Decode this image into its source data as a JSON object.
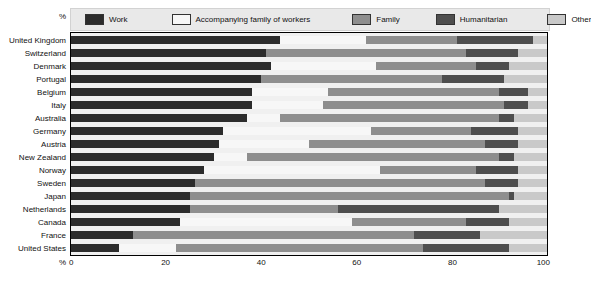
{
  "chart": {
    "title": "",
    "axis_unit_label": "%",
    "xlabel": "",
    "ylabel": ""
  },
  "legend": {
    "unit": "%",
    "items": [
      {
        "label": "Work",
        "color": "#2c2c2c",
        "key": "work"
      },
      {
        "label": "Accompanying family of workers",
        "color": "#f7f7f7",
        "key": "accomp"
      },
      {
        "label": "Family",
        "color": "#8e8e8e",
        "key": "family"
      },
      {
        "label": "Humanitarian",
        "color": "#4e4e4e",
        "key": "human"
      },
      {
        "label": "Other",
        "color": "#c9c9c9",
        "key": "other"
      }
    ]
  },
  "chart_data": {
    "type": "bar",
    "orientation": "horizontal",
    "stacked": true,
    "stack_total": 100,
    "title": "",
    "xlabel": "%",
    "ylabel": "",
    "xlim": [
      0,
      100
    ],
    "xticks": [
      0,
      20,
      40,
      60,
      80,
      100
    ],
    "grid": false,
    "legend_position": "top",
    "categories": [
      "United Kingdom",
      "Switzerland",
      "Denmark",
      "Portugal",
      "Belgium",
      "Italy",
      "Australia",
      "Germany",
      "Austria",
      "New Zealand",
      "Norway",
      "Sweden",
      "Japan",
      "Netherlands",
      "Canada",
      "France",
      "United States"
    ],
    "series": [
      {
        "name": "Work",
        "color": "#2c2c2c",
        "values": [
          44,
          41,
          42,
          40,
          38,
          38,
          37,
          32,
          31,
          30,
          28,
          26,
          25,
          25,
          23,
          13,
          10
        ]
      },
      {
        "name": "Accompanying family of workers",
        "color": "#f7f7f7",
        "values": [
          18,
          0,
          22,
          0,
          16,
          15,
          7,
          31,
          19,
          7,
          37,
          0,
          0,
          0,
          36,
          0,
          12
        ]
      },
      {
        "name": "Family",
        "color": "#8e8e8e",
        "values": [
          19,
          42,
          21,
          38,
          36,
          38,
          46,
          21,
          37,
          53,
          20,
          61,
          67,
          31,
          24,
          59,
          52
        ]
      },
      {
        "name": "Humanitarian",
        "color": "#4e4e4e",
        "values": [
          16,
          11,
          7,
          13,
          6,
          5,
          3,
          10,
          7,
          3,
          9,
          7,
          1,
          34,
          9,
          14,
          18
        ]
      },
      {
        "name": "Other",
        "color": "#c9c9c9",
        "values": [
          3,
          6,
          8,
          9,
          4,
          4,
          7,
          6,
          6,
          7,
          6,
          6,
          7,
          10,
          8,
          14,
          8
        ]
      }
    ]
  }
}
